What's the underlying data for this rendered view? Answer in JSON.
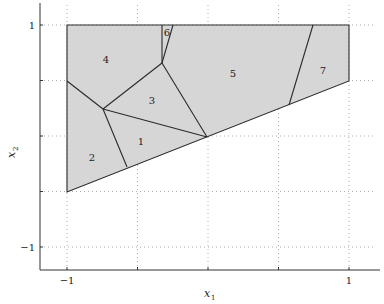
{
  "figure": {
    "xlabel": "x",
    "xlabel_sub": "1",
    "ylabel": "x",
    "ylabel_sub": "2",
    "x_ticks": [
      {
        "value": -1,
        "label": "−1"
      },
      {
        "value": 1,
        "label": "1"
      }
    ],
    "y_ticks": [
      {
        "value": 1,
        "label": "1"
      },
      {
        "value": -1,
        "label": "−1"
      }
    ],
    "region_labels": [
      "1",
      "2",
      "3",
      "4",
      "5",
      "6",
      "7"
    ]
  }
}
